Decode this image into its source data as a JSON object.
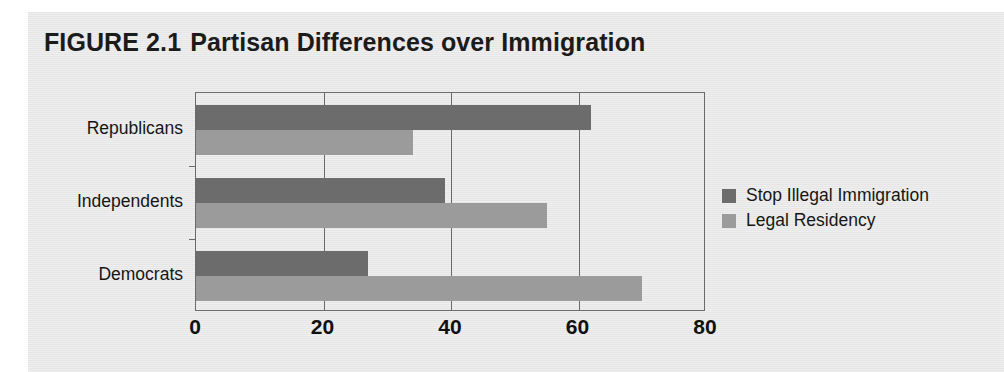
{
  "figure": {
    "label": "FIGURE 2.1",
    "caption": "Partisan Differences over Immigration"
  },
  "colors": {
    "series_0": "#6c6c6c",
    "series_1": "#9b9b9b",
    "panel_background": "#e8e8e8",
    "axis": "#6a6a6a",
    "text": "#161616"
  },
  "chart_data": {
    "type": "bar",
    "orientation": "horizontal",
    "xlabel": "",
    "ylabel": "",
    "categories": [
      "Republicans",
      "Independents",
      "Democrats"
    ],
    "series": [
      {
        "name": "Stop Illegal Immigration",
        "color": "#6c6c6c",
        "values": [
          62,
          39,
          27
        ]
      },
      {
        "name": "Legal Residency",
        "color": "#9b9b9b",
        "values": [
          34,
          55,
          70
        ]
      }
    ],
    "xlim": [
      0,
      80
    ],
    "xticks": [
      0,
      20,
      40,
      60,
      80
    ],
    "xtick_labels": [
      "0",
      "20",
      "40",
      "60",
      "80"
    ],
    "grid": true,
    "legend_position": "right"
  }
}
